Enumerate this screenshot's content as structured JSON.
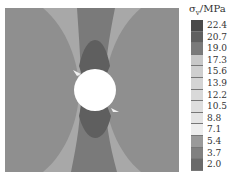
{
  "chart_data": {
    "type": "heatmap",
    "title": "",
    "subtype": "contour",
    "colorbar": {
      "label": "σ_v/MPa",
      "label_symbol": "σ",
      "label_subscript": "v",
      "label_unit": "/MPa",
      "levels": [
        22.4,
        20.7,
        19.0,
        17.3,
        15.6,
        13.9,
        12.2,
        10.5,
        8.8,
        7.1,
        5.4,
        3.7,
        2.0
      ],
      "colors": [
        "#4a4a4a",
        "#606060",
        "#7a7a7a",
        "#c8c8c8",
        "#cfcfcf",
        "#d4d4d4",
        "#d9d9d9",
        "#dedede",
        "#e4e4e4",
        "#ededed",
        "#9a9a9a",
        "#808080",
        "#6a6a6a"
      ]
    },
    "regions": [
      {
        "name": "left-lobe",
        "level_range": [
          3.7,
          5.4
        ],
        "color": "#8e8e8e"
      },
      {
        "name": "right-lobe",
        "level_range": [
          3.7,
          5.4
        ],
        "color": "#8e8e8e"
      },
      {
        "name": "corner-zones",
        "level_range": [
          5.4,
          7.1
        ],
        "color": "#a6a6a6"
      },
      {
        "name": "vertical-band",
        "level_range": [
          2.0,
          3.7
        ],
        "color": "#7c7c7c"
      },
      {
        "name": "hole-top-bottom-concentration",
        "level_range": [
          19.0,
          22.4
        ],
        "color": "#5e5e5e"
      },
      {
        "name": "hole",
        "color": "#ffffff"
      }
    ],
    "xlabel": "",
    "ylabel": ""
  }
}
